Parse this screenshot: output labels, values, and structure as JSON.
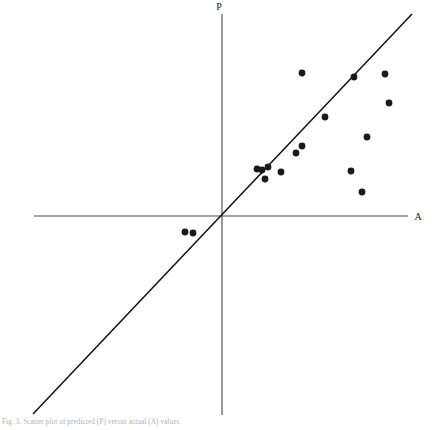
{
  "figure": {
    "type": "scatter-with-reference-line",
    "background_color": "#ffffff",
    "ink_color": "#1a1a1a",
    "axis_color": "#4a4a4a",
    "caption_text": "Fig. 3. Scatter plot of predicted (P) versus actual (A) values.",
    "caption_color": "#6f6f73"
  },
  "axes": {
    "vertical_label": "P",
    "horizontal_label": "A",
    "origin_px": [
      222,
      216
    ],
    "vertical_axis_px": {
      "x": 222,
      "y_top": 14,
      "y_bottom": 415
    },
    "horizontal_axis_px": {
      "y": 216,
      "x_left": 34,
      "x_right": 408
    }
  },
  "reference_line": {
    "name": "identity-line",
    "slope_label": "45-degree",
    "start_px": [
      33,
      414
    ],
    "end_px": [
      412,
      14
    ]
  },
  "chart_data": {
    "type": "scatter",
    "title": "",
    "xlabel": "A",
    "ylabel": "P",
    "xlim": [
      -4.8,
      4.8
    ],
    "ylim": [
      -5.1,
      5.1
    ],
    "grid": false,
    "legend": "none",
    "annotations": [
      "identity line y = x"
    ],
    "point_count": 17,
    "points_px": [
      [
        185,
        232
      ],
      [
        193,
        233
      ],
      [
        257,
        169
      ],
      [
        262,
        170
      ],
      [
        265,
        179
      ],
      [
        281,
        172
      ],
      [
        296,
        153
      ],
      [
        302,
        146
      ],
      [
        302,
        73
      ],
      [
        325,
        117
      ],
      [
        354,
        77
      ],
      [
        351,
        171
      ],
      [
        362,
        192
      ],
      [
        367,
        137
      ],
      [
        385,
        74
      ],
      [
        389,
        103
      ],
      [
        268,
        167
      ]
    ],
    "points": [
      {
        "x": -0.95,
        "y": -0.41
      },
      {
        "x": -0.75,
        "y": -0.44
      },
      {
        "x": 0.9,
        "y": 1.21
      },
      {
        "x": 1.03,
        "y": 1.18
      },
      {
        "x": 1.1,
        "y": 0.95
      },
      {
        "x": 1.51,
        "y": 1.13
      },
      {
        "x": 1.89,
        "y": 1.62
      },
      {
        "x": 2.04,
        "y": 1.79
      },
      {
        "x": 2.04,
        "y": 3.66
      },
      {
        "x": 2.62,
        "y": 2.54
      },
      {
        "x": 3.36,
        "y": 3.56
      },
      {
        "x": 3.28,
        "y": 1.15
      },
      {
        "x": 3.56,
        "y": 0.62
      },
      {
        "x": 3.69,
        "y": 2.03
      },
      {
        "x": 4.15,
        "y": 3.64
      },
      {
        "x": 4.25,
        "y": 2.9
      },
      {
        "x": 1.18,
        "y": 1.26
      }
    ]
  }
}
